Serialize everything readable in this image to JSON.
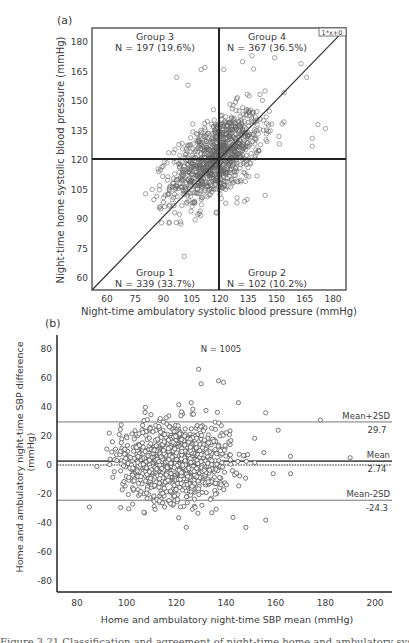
{
  "chart_data": [
    {
      "panel_label": "(a)",
      "type": "scatter",
      "title": "",
      "xlabel": "Night-time ambulatory systolic blood pressure (mmHg)",
      "ylabel": "Night-time home systolic blood pressure (mmHg)",
      "xlim": [
        52,
        187
      ],
      "ylim": [
        54,
        187
      ],
      "xticks": [
        60,
        75,
        90,
        105,
        120,
        135,
        150,
        165,
        180
      ],
      "yticks": [
        60,
        75,
        90,
        105,
        120,
        135,
        150,
        165,
        180
      ],
      "grid": false,
      "reference_lines": {
        "horizontal": 120,
        "vertical": 120,
        "identity_label": "1*x+0"
      },
      "quadrants": [
        {
          "name": "Group 3",
          "n_label": "N = 197 (19.6%)",
          "n": 197,
          "pct": 19.6,
          "position": "top-left"
        },
        {
          "name": "Group 4",
          "n_label": "N = 367 (36.5%)",
          "n": 367,
          "pct": 36.5,
          "position": "top-right"
        },
        {
          "name": "Group 1",
          "n_label": "N = 339 (33.7%)",
          "n": 339,
          "pct": 33.7,
          "position": "bottom-left"
        },
        {
          "name": "Group 2",
          "n_label": "N = 102 (10.2%)",
          "n": 102,
          "pct": 10.2,
          "position": "bottom-right"
        }
      ],
      "points_summary": {
        "n": 1005,
        "x_mean": 118,
        "y_mean": 121,
        "x_sd": 12,
        "y_sd": 12,
        "corr": 0.55
      },
      "notable_points": [
        [
          101,
          71
        ],
        [
          97,
          162
        ],
        [
          103,
          158
        ],
        [
          110,
          166
        ],
        [
          112,
          167
        ],
        [
          122,
          166
        ],
        [
          137,
          173
        ],
        [
          149,
          172
        ],
        [
          132,
          170
        ],
        [
          166,
          162
        ],
        [
          163,
          169
        ],
        [
          172,
          138
        ],
        [
          176,
          136
        ],
        [
          169,
          127
        ],
        [
          169,
          131
        ],
        [
          84,
          105
        ],
        [
          89,
          88
        ],
        [
          88,
          107
        ],
        [
          118,
          93
        ],
        [
          123,
          98
        ],
        [
          144,
          102
        ],
        [
          133,
          99
        ]
      ]
    },
    {
      "panel_label": "(b)",
      "type": "scatter",
      "subtype": "bland-altman",
      "title": "N = 1005",
      "xlabel": "Home and ambulatory night-time SBP mean (mmHg)",
      "ylabel": "Home and ambulatory night-time SBP difference (mmHg)",
      "ylabel_lines": [
        "Home and ambulatory night-time SBP difference",
        "(mmHg)"
      ],
      "xlim": [
        74,
        207
      ],
      "ylim": [
        -88,
        90
      ],
      "xticks": [
        80,
        100,
        120,
        140,
        160,
        180,
        200
      ],
      "yticks": [
        80,
        60,
        40,
        20,
        0,
        -20,
        -40,
        -60,
        -80
      ],
      "grid": false,
      "reference_lines": [
        {
          "name": "Mean+2SD",
          "value": 29.7,
          "label": "Mean+2SD",
          "value_label": "29.7",
          "style": "solid"
        },
        {
          "name": "Mean",
          "value": 2.74,
          "label": "Mean",
          "value_label": "2.74",
          "style": "solid-bold"
        },
        {
          "name": "Zero",
          "value": 0,
          "style": "dotted"
        },
        {
          "name": "Mean-2SD",
          "value": -24.3,
          "label": "Mean-2SD",
          "value_label": "-24.3",
          "style": "solid"
        }
      ],
      "points_summary": {
        "n": 1005,
        "x_mean": 120,
        "x_sd": 11,
        "diff_mean": 2.74,
        "diff_sd": 13.5
      },
      "notable_points": [
        [
          129,
          66
        ],
        [
          130,
          56
        ],
        [
          137,
          58
        ],
        [
          139,
          57
        ],
        [
          85,
          -29
        ],
        [
          88,
          -1
        ],
        [
          178,
          31
        ],
        [
          190,
          5
        ],
        [
          124,
          -43
        ],
        [
          148,
          -43
        ],
        [
          145,
          43
        ],
        [
          126,
          43
        ],
        [
          156,
          36
        ],
        [
          161,
          24
        ],
        [
          166,
          6
        ],
        [
          166,
          -6
        ],
        [
          159,
          -6
        ],
        [
          156,
          -38
        ],
        [
          93,
          22
        ],
        [
          97,
          21
        ],
        [
          92,
          11
        ],
        [
          94,
          9
        ]
      ]
    }
  ],
  "labels": {
    "panel_a": "(a)",
    "panel_b": "(b)",
    "identity_legend": "1*x+0",
    "n_total": "N = 1005",
    "caption_partial": "Figure 3.21 Classification and agreement of night-time home and ambulatory systolic blood"
  }
}
